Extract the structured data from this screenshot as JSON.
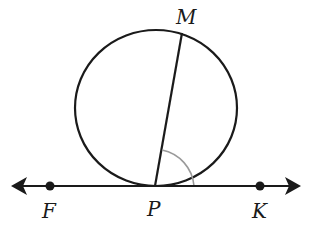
{
  "diagram": {
    "colors": {
      "stroke": "#1a1a1a",
      "angle_mark": "#9a9a9a",
      "background": "#ffffff"
    },
    "circle": {
      "cx": 156,
      "cy": 108,
      "rx": 81,
      "ry": 78
    },
    "tangent_line": {
      "y": 186,
      "x1": 12,
      "x2": 300,
      "arrows": "both"
    },
    "chord": {
      "from": "P",
      "to": "M"
    },
    "angle_mark": {
      "vertex": "P",
      "between": [
        "PM",
        "PK"
      ],
      "radius": 40
    },
    "points": [
      {
        "label": "M",
        "x": 182,
        "y": 33
      },
      {
        "label": "F",
        "x": 50,
        "y": 186
      },
      {
        "label": "P",
        "x": 155,
        "y": 186
      },
      {
        "label": "K",
        "x": 260,
        "y": 186
      }
    ],
    "labels": {
      "M": "M",
      "F": "F",
      "P": "P",
      "K": "K"
    }
  }
}
